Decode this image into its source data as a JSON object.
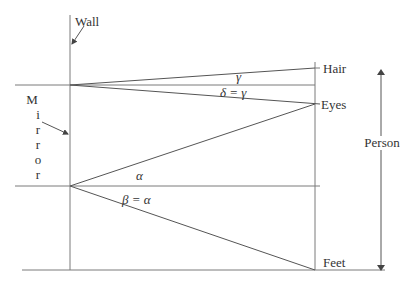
{
  "diagram": {
    "labels": {
      "wall": "Wall",
      "mirror_letters": [
        "M",
        "i",
        "r",
        "r",
        "o",
        "r"
      ],
      "hair": "Hair",
      "eyes": "Eyes",
      "feet": "Feet",
      "person": "Person",
      "gamma": "γ",
      "delta_eq_gamma": "δ = γ",
      "alpha": "α",
      "beta_eq_alpha": "β = α"
    },
    "colors": {
      "line": "#7a7a7a",
      "ray": "#555555",
      "text": "#333333",
      "background": "#ffffff"
    }
  }
}
